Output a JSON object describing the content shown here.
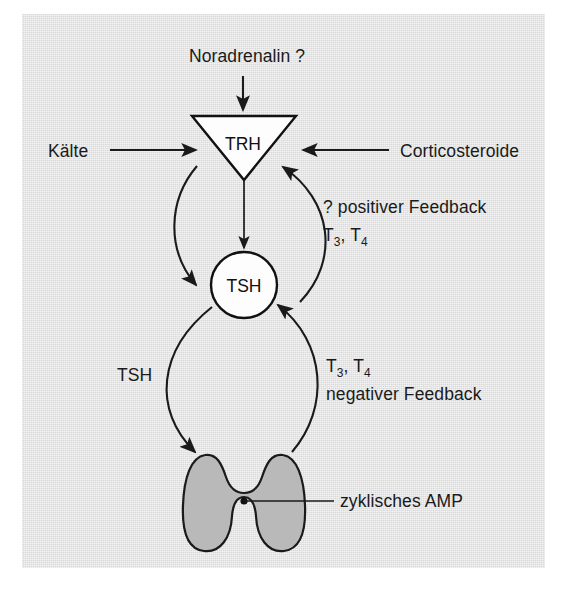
{
  "figure": {
    "panel_background": "#e2e2e2",
    "title": "",
    "nodes": {
      "trh": {
        "label": "TRH",
        "shape": "inverted-triangle",
        "fill": "#fdfdfd"
      },
      "tsh": {
        "label": "TSH",
        "shape": "circle",
        "fill": "#fdfdfd"
      },
      "thyroid": {
        "label": "",
        "shape": "thyroid-gland",
        "fill": "#b9b9b9"
      }
    },
    "labels": {
      "noradrenalin": "Noradrenalin ?",
      "kaelte": "Kälte",
      "corticosteroide": "Corticosteroide",
      "positive_feedback": "? positiver Feedback",
      "positive_feedback_hormones_base": "T",
      "positive_feedback_t3_sub": "3",
      "positive_feedback_sep": ", T",
      "positive_feedback_t4_sub": "4",
      "negative_feedback_hormones_base": "T",
      "negative_feedback_t3_sub": "3",
      "negative_feedback_sep": ", T",
      "negative_feedback_t4_sub": "4",
      "negative_feedback": "negativer  Feedback",
      "tsh_pathway": "TSH",
      "cyclic_amp": "zyklisches AMP"
    },
    "arrows": [
      {
        "name": "noradrenalin-to-trh",
        "from": "Noradrenalin ?",
        "to": "TRH",
        "direction": "down"
      },
      {
        "name": "kaelte-to-trh",
        "from": "Kälte",
        "to": "TRH",
        "direction": "right"
      },
      {
        "name": "corticosteroide-to-trh",
        "from": "Corticosteroide",
        "to": "TRH",
        "direction": "left"
      },
      {
        "name": "trh-to-tsh-direct",
        "from": "TRH",
        "to": "TSH",
        "direction": "down"
      },
      {
        "name": "trh-to-tsh-curve",
        "from": "TRH",
        "to": "TSH",
        "direction": "down-left-curve"
      },
      {
        "name": "tsh-to-trh-positive-feedback",
        "from": "TSH",
        "to": "TRH",
        "direction": "up-right-curve"
      },
      {
        "name": "tsh-to-thyroid",
        "from": "TSH",
        "to": "thyroid",
        "direction": "down-left-curve"
      },
      {
        "name": "thyroid-to-tsh-negative-feedback",
        "from": "thyroid",
        "to": "TSH",
        "direction": "up-right-curve"
      },
      {
        "name": "cyclic-amp-leader",
        "from": "zyklisches AMP",
        "to": "thyroid",
        "direction": "leader-line"
      }
    ],
    "colors": {
      "line": "#1a1a1a",
      "text": "#1a1a1a",
      "gland_fill": "#b9b9b9",
      "node_fill": "#fdfdfd",
      "panel": "#e2e2e2",
      "page": "#ffffff"
    }
  }
}
